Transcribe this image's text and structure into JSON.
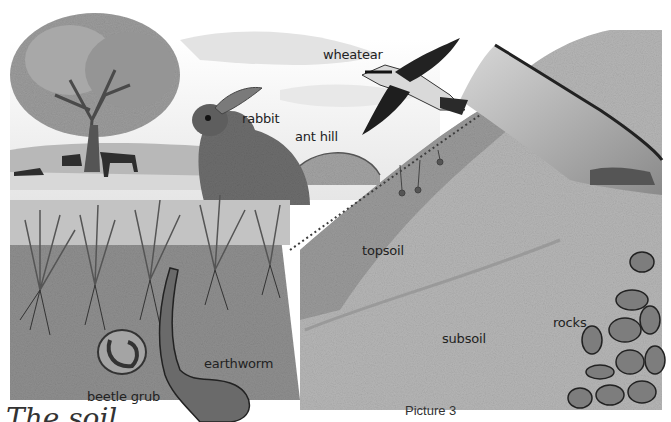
{
  "title": "The soil",
  "caption": "Picture 3",
  "labels": {
    "wheatear": "wheatear",
    "rabbit": "rabbit",
    "ant_hill": "ant hill",
    "topsoil": "topsoil",
    "subsoil": "subsoil",
    "rocks": "rocks",
    "earthworm": "earthworm",
    "beetle_grub": "beetle grub"
  },
  "colors": {
    "sky": "#f4f4f4",
    "hill": "#c9c9c9",
    "topsoil": "#8e8e8e",
    "subsoil": "#b4b4b4",
    "grass": "#6e6e6e",
    "dark": "#2a2a2a"
  }
}
